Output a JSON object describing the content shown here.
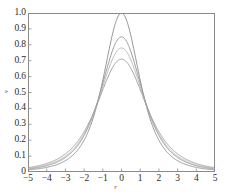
{
  "chart_data": {
    "type": "line",
    "title": "",
    "xlabel": "r",
    "ylabel": "v",
    "xlim": [
      -5,
      5
    ],
    "ylim": [
      0,
      1.0
    ],
    "grid": false,
    "legend": "none",
    "xticks": [
      "-5",
      "-4",
      "-3",
      "-2",
      "-1",
      "0",
      "1",
      "2",
      "3",
      "4",
      "5"
    ],
    "xtick_values": [
      -5,
      -4,
      -3,
      -2,
      -1,
      0,
      1,
      2,
      3,
      4,
      5
    ],
    "yticks": [
      "0",
      "0.1",
      "0.2",
      "0.3",
      "0.4",
      "0.5",
      "0.6",
      "0.7",
      "0.8",
      "0.9",
      "1.0"
    ],
    "ytick_values": [
      0,
      0.1,
      0.2,
      0.3,
      0.4,
      0.5,
      0.6,
      0.7,
      0.8,
      0.9,
      1.0
    ],
    "series": [
      {
        "name": "curve-1",
        "peak": 1.0,
        "half_width": 1.25,
        "color": "#8a8a8a",
        "x": [
          -5,
          -4.5,
          -4,
          -3.5,
          -3,
          -2.5,
          -2,
          -1.75,
          -1.5,
          -1.25,
          -1,
          -0.75,
          -0.5,
          -0.25,
          0,
          0.25,
          0.5,
          0.75,
          1,
          1.25,
          1.5,
          1.75,
          2,
          2.5,
          3,
          3.5,
          4,
          4.5,
          5
        ],
        "y": [
          0.059,
          0.072,
          0.089,
          0.113,
          0.148,
          0.2,
          0.281,
          0.338,
          0.41,
          0.5,
          0.61,
          0.735,
          0.862,
          0.962,
          1.0,
          0.962,
          0.862,
          0.735,
          0.61,
          0.5,
          0.41,
          0.338,
          0.281,
          0.2,
          0.148,
          0.113,
          0.089,
          0.072,
          0.059
        ]
      },
      {
        "name": "curve-2",
        "peak": 0.85,
        "half_width": 1.45,
        "color": "#8e8e8e",
        "x": [
          -5,
          -4.5,
          -4,
          -3.5,
          -3,
          -2.5,
          -2,
          -1.75,
          -1.5,
          -1.25,
          -1,
          -0.75,
          -0.5,
          -0.25,
          0,
          0.25,
          0.5,
          0.75,
          1,
          1.25,
          1.5,
          1.75,
          2,
          2.5,
          3,
          3.5,
          4,
          4.5,
          5
        ],
        "y": [
          0.065,
          0.079,
          0.098,
          0.124,
          0.161,
          0.217,
          0.3,
          0.357,
          0.425,
          0.51,
          0.608,
          0.712,
          0.806,
          0.864,
          0.85,
          0.864,
          0.806,
          0.712,
          0.608,
          0.51,
          0.425,
          0.357,
          0.3,
          0.217,
          0.161,
          0.124,
          0.098,
          0.079,
          0.065
        ]
      },
      {
        "name": "curve-3",
        "peak": 0.78,
        "half_width": 1.55,
        "color": "#b4b4b4",
        "x": [
          -5,
          -4.5,
          -4,
          -3.5,
          -3,
          -2.5,
          -2,
          -1.75,
          -1.5,
          -1.25,
          -1,
          -0.75,
          -0.5,
          -0.25,
          0,
          0.25,
          0.5,
          0.75,
          1,
          1.25,
          1.5,
          1.75,
          2,
          2.5,
          3,
          3.5,
          4,
          4.5,
          5
        ],
        "y": [
          0.068,
          0.083,
          0.103,
          0.13,
          0.169,
          0.226,
          0.31,
          0.366,
          0.432,
          0.513,
          0.602,
          0.692,
          0.762,
          0.793,
          0.78,
          0.793,
          0.762,
          0.692,
          0.602,
          0.513,
          0.432,
          0.366,
          0.31,
          0.226,
          0.169,
          0.13,
          0.103,
          0.083,
          0.068
        ]
      },
      {
        "name": "curve-4",
        "peak": 0.71,
        "half_width": 1.7,
        "color": "#9a9a9a",
        "x": [
          -5,
          -4.5,
          -4,
          -3.5,
          -3,
          -2.5,
          -2,
          -1.75,
          -1.5,
          -1.25,
          -1,
          -0.75,
          -0.5,
          -0.25,
          0,
          0.25,
          0.5,
          0.75,
          1,
          1.25,
          1.5,
          1.75,
          2,
          2.5,
          3,
          3.5,
          4,
          4.5,
          5
        ],
        "y": [
          0.072,
          0.088,
          0.109,
          0.138,
          0.178,
          0.237,
          0.32,
          0.374,
          0.436,
          0.51,
          0.589,
          0.661,
          0.709,
          0.722,
          0.71,
          0.722,
          0.709,
          0.661,
          0.589,
          0.51,
          0.436,
          0.374,
          0.32,
          0.237,
          0.178,
          0.138,
          0.109,
          0.088,
          0.072
        ]
      }
    ]
  }
}
